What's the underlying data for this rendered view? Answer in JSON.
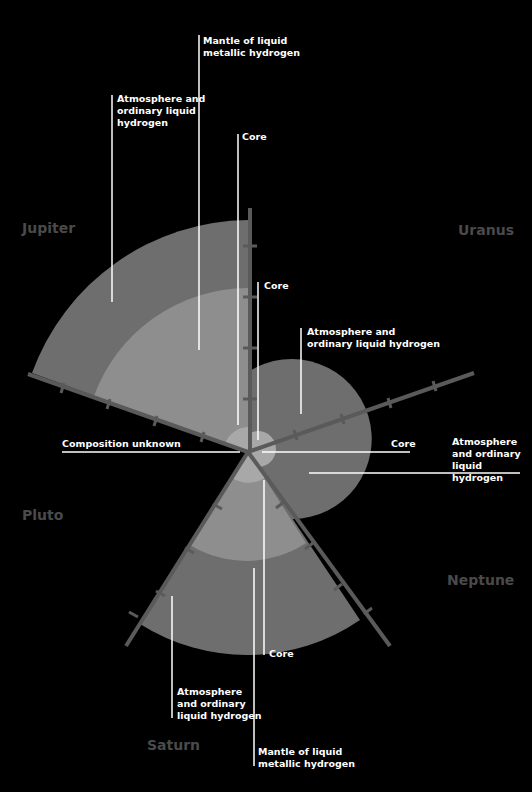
{
  "planets": {
    "jupiter": "Jupiter",
    "uranus": "Uranus",
    "pluto": "Pluto",
    "saturn": "Saturn",
    "neptune": "Neptune"
  },
  "labels": {
    "jupiter_mantle": "Mantle of liquid\nmetallic hydrogen",
    "jupiter_atmosphere": "Atmosphere and\nordinary liquid\nhydrogen",
    "jupiter_core": "Core",
    "uranus_core_top": "Core",
    "uranus_atmosphere": "Atmosphere and\nordinary liquid hydrogen",
    "pluto_composition": "Composition unknown",
    "neptune_core": "Core",
    "neptune_atmosphere": "Atmosphere\nand ordinary\nliquid hydrogen",
    "saturn_core": "Core",
    "saturn_atmosphere": "Atmosphere\nand ordinary\nliquid hydrogen",
    "saturn_mantle": "Mantle of liquid\nmetallic hydrogen"
  },
  "colors": {
    "background": "#000000",
    "outer_layer": "#6e6e6e",
    "inner_layer": "#8e8e8e",
    "core": "#a8a8a8",
    "axis": "#5a5a5a",
    "planet_name": "#4a4a4a",
    "leader_line": "#ffffff"
  }
}
